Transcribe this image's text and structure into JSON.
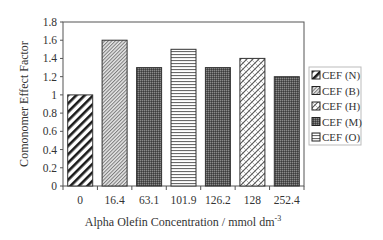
{
  "chart_data": {
    "type": "bar",
    "title": "",
    "xlabel": "Alpha Olefin Concentration / mmol dm",
    "xlabel_superscript": "-3",
    "ylabel": "Comonomer Effect Factor",
    "ylim": [
      0,
      1.8
    ],
    "yticks": [
      "0",
      "0.2",
      "0.4",
      "0.6",
      "0.8",
      "1",
      "1.2",
      "1.4",
      "1.6",
      "1.8"
    ],
    "categories": [
      "0",
      "16.4",
      "63.1",
      "101.9",
      "126.2",
      "128",
      "252.4"
    ],
    "values": [
      1.0,
      1.6,
      1.3,
      1.5,
      1.3,
      1.4,
      1.2
    ],
    "bar_series": [
      "CEF (N)",
      "CEF (B)",
      "CEF (M)",
      "CEF (O)",
      "CEF (M)",
      "CEF (H)",
      "CEF (M)"
    ],
    "grid": false,
    "legend_position": "right",
    "legend": [
      "CEF (N)",
      "CEF (B)",
      "CEF (H)",
      "CEF (M)",
      "CEF (O)"
    ]
  },
  "legend_items": [
    {
      "label": "CEF (N)",
      "pattern": "diag-wide"
    },
    {
      "label": "CEF (B)",
      "pattern": "diag-fine"
    },
    {
      "label": "CEF (H)",
      "pattern": "zigzag"
    },
    {
      "label": "CEF (M)",
      "pattern": "dark-dots"
    },
    {
      "label": "CEF (O)",
      "pattern": "horiz"
    }
  ],
  "bar_patterns": [
    "diag-wide",
    "diag-fine",
    "dark-dots",
    "horiz",
    "dark-dots",
    "zigzag",
    "dark-dots"
  ]
}
